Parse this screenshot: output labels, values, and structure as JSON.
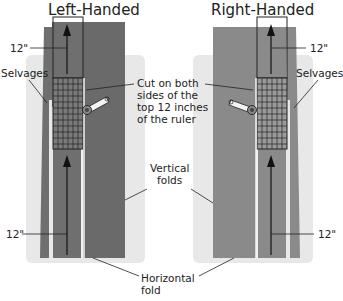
{
  "diagram": {
    "left": {
      "title": "Left-Handed",
      "label_top_12": "12\"",
      "label_bottom_12": "12\"",
      "label_selvages": "Selvages"
    },
    "right": {
      "title": "Right-Handed",
      "label_top_12": "12\"",
      "label_bottom_12": "12\"",
      "label_selvages": "Selvages"
    },
    "center_callout": {
      "line1": "Cut on both",
      "line2": "sides of the",
      "line3": "top 12 inches",
      "line4": "of the ruler"
    },
    "vertical_folds": {
      "line1": "Vertical",
      "line2": "folds"
    },
    "horizontal_fold": {
      "line1": "Horizontal",
      "line2": "fold"
    },
    "colors": {
      "mat": "#e6e6e6",
      "fabric_dark": "#6e6e6e",
      "fabric_light": "#8a8a8a",
      "ruler_grid": "#222222",
      "line": "#222222"
    }
  }
}
